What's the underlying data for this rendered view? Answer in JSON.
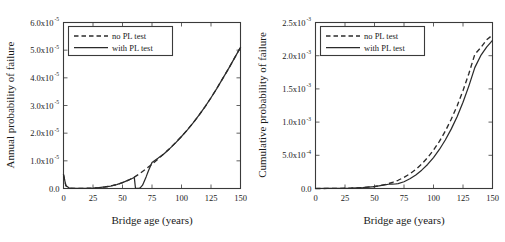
{
  "figure": {
    "panels": [
      "left",
      "right"
    ]
  },
  "chart_data": [
    {
      "type": "line",
      "panel": "left",
      "title": "",
      "xlabel": "Bridge age (years)",
      "ylabel": "Annual probability of failure",
      "xlim": [
        0,
        150
      ],
      "ylim": [
        0,
        6e-05
      ],
      "xticks": [
        0,
        25,
        50,
        75,
        100,
        125,
        150
      ],
      "xtick_labels": [
        "0",
        "25",
        "50",
        "75",
        "100",
        "125",
        "150"
      ],
      "yticks": [
        0,
        1e-05,
        2e-05,
        3e-05,
        4e-05,
        5e-05,
        6e-05
      ],
      "ytick_labels": [
        "0.0",
        "1.0x10",
        "2.0x10",
        "3.0x10",
        "4.0x10",
        "5.0x10",
        "6.0x10"
      ],
      "ytick_exponents": [
        "",
        "-5",
        "-5",
        "-5",
        "-5",
        "-5",
        "-5"
      ],
      "grid": true,
      "legend_position": "upper-left",
      "series": [
        {
          "name": "no PL test",
          "style": "dashed",
          "x": [
            0,
            2,
            5,
            10,
            15,
            20,
            25,
            30,
            35,
            40,
            45,
            50,
            55,
            60,
            65,
            70,
            75,
            80,
            85,
            90,
            95,
            100,
            105,
            110,
            115,
            120,
            125,
            130,
            135,
            140,
            145,
            150
          ],
          "y": [
            5e-06,
            1e-06,
            1.5e-07,
            4e-08,
            5e-08,
            8e-08,
            1.5e-07,
            3e-07,
            5.5e-07,
            9e-07,
            1.4e-06,
            2.1e-06,
            3e-06,
            4.1e-06,
            5.5e-06,
            7.1e-06,
            8.8e-06,
            1.06e-05,
            1.25e-05,
            1.45e-05,
            1.66e-05,
            1.88e-05,
            2.12e-05,
            2.38e-05,
            2.66e-05,
            2.96e-05,
            3.28e-05,
            3.62e-05,
            3.98e-05,
            4.34e-05,
            4.72e-05,
            5.1e-05
          ]
        },
        {
          "name": "with PL test",
          "style": "solid",
          "x": [
            0,
            2,
            5,
            10,
            15,
            20,
            25,
            30,
            35,
            40,
            45,
            50,
            55,
            59,
            60,
            61,
            62,
            63,
            64,
            65,
            67,
            70,
            72,
            75,
            80,
            85,
            90,
            95,
            100,
            105,
            110,
            115,
            120,
            125,
            130,
            135,
            140,
            145,
            150
          ],
          "y": [
            5e-06,
            1e-06,
            1.5e-07,
            4e-08,
            5e-08,
            8e-08,
            1.5e-07,
            3e-07,
            5.5e-07,
            9e-07,
            1.4e-06,
            2.1e-06,
            3e-06,
            3.8e-06,
            4e-06,
            1e-07,
            5e-08,
            6e-08,
            1e-07,
            2e-07,
            1.2e-06,
            4.2e-06,
            6.4e-06,
            9.4e-06,
            1.09e-05,
            1.25e-05,
            1.44e-05,
            1.65e-05,
            1.88e-05,
            2.12e-05,
            2.38e-05,
            2.66e-05,
            2.96e-05,
            3.28e-05,
            3.62e-05,
            3.98e-05,
            4.34e-05,
            4.72e-05,
            5.1e-05
          ]
        }
      ]
    },
    {
      "type": "line",
      "panel": "right",
      "title": "",
      "xlabel": "Bridge age (years)",
      "ylabel": "Cumulative probability of failure",
      "xlim": [
        0,
        150
      ],
      "ylim": [
        0,
        0.0025
      ],
      "xticks": [
        0,
        25,
        50,
        75,
        100,
        125,
        150
      ],
      "xtick_labels": [
        "0",
        "25",
        "50",
        "75",
        "100",
        "125",
        "150"
      ],
      "yticks": [
        0,
        0.0005,
        0.001,
        0.0015,
        0.002,
        0.0025
      ],
      "ytick_labels": [
        "0.0",
        "5.0x10",
        "1.0x10",
        "1.5x10",
        "2.0x10",
        "2.5x10"
      ],
      "ytick_exponents": [
        "",
        "-4",
        "-3",
        "-3",
        "-3",
        "-3"
      ],
      "grid": true,
      "legend_position": "upper-left",
      "series": [
        {
          "name": "no PL test",
          "style": "dashed",
          "x": [
            0,
            10,
            20,
            30,
            40,
            50,
            55,
            60,
            65,
            70,
            75,
            80,
            85,
            90,
            95,
            100,
            105,
            110,
            115,
            120,
            125,
            130,
            135,
            140,
            145,
            150
          ],
          "y": [
            0,
            1e-06,
            2.5e-06,
            6e-06,
            1.4e-05,
            3e-05,
            4.4e-05,
            6.4e-05,
            9e-05,
            0.000124,
            0.000168,
            0.000222,
            0.000288,
            0.000368,
            0.000464,
            0.000578,
            0.00071,
            0.000864,
            0.001042,
            0.001244,
            0.001474,
            0.001732,
            0.00202,
            0.00212,
            0.00224,
            0.00231
          ]
        },
        {
          "name": "with PL test",
          "style": "solid",
          "x": [
            0,
            10,
            20,
            30,
            40,
            50,
            55,
            60,
            62,
            65,
            68,
            70,
            75,
            80,
            85,
            90,
            95,
            100,
            105,
            110,
            115,
            120,
            125,
            130,
            135,
            140,
            145,
            150
          ],
          "y": [
            0,
            1e-06,
            2.5e-06,
            6e-06,
            1.4e-05,
            3e-05,
            4.4e-05,
            6e-05,
            6.4e-05,
            6.6e-05,
            6.8e-05,
            7.4e-05,
            0.000102,
            0.000146,
            0.000204,
            0.000276,
            0.000362,
            0.000466,
            0.000588,
            0.00073,
            0.000894,
            0.001082,
            0.0013,
            0.001546,
            0.00182,
            0.002,
            0.00213,
            0.00223
          ]
        }
      ]
    }
  ]
}
